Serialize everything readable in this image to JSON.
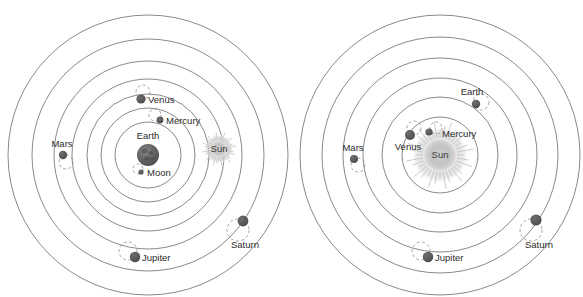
{
  "figure": {
    "title_visible": false,
    "background": "#ffffff",
    "orbit_stroke": "#6b6b6b",
    "epicycle_stroke": "#8d8d8d",
    "planet_fill": "#5a5a5a",
    "sun_fill": "#b9b9b9",
    "earth_fill": "#636363",
    "label_color": "#2b2b2b"
  },
  "diagrams": [
    {
      "id": "geocentric-model",
      "name": "ptolemaic-geocentric-diagram",
      "center": {
        "x": 148,
        "y": 155
      },
      "center_body": {
        "name": "Earth",
        "label": "Earth",
        "r": 11,
        "kind": "earth",
        "label_dx": 0,
        "label_dy": -16
      },
      "orbits": [
        140,
        116,
        94,
        76,
        61,
        47,
        33
      ],
      "bodies": [
        {
          "name": "Moon",
          "label": "Moon",
          "x": 141,
          "y": 172,
          "r": 2.6,
          "epicycle": {
            "cx": 138,
            "cy": 169,
            "r": 5
          },
          "label_dx": 6,
          "label_dy": 4,
          "anchor": "start"
        },
        {
          "name": "Sun",
          "label": "Sun",
          "x": 219,
          "y": 149,
          "r": 8.5,
          "kind": "sun",
          "label_dx": 0,
          "label_dy": 3,
          "anchor": "middle"
        },
        {
          "name": "Mercury",
          "label": "Mercury",
          "x": 160,
          "y": 120,
          "r": 3.4,
          "epicycle": {
            "cx": 155,
            "cy": 115,
            "r": 6
          },
          "label_dx": 6,
          "label_dy": 4,
          "anchor": "start"
        },
        {
          "name": "Venus",
          "label": "Venus",
          "x": 141,
          "y": 99,
          "r": 4.6,
          "epicycle": {
            "cx": 143,
            "cy": 92,
            "r": 7
          },
          "label_dx": 7,
          "label_dy": 4,
          "anchor": "start"
        },
        {
          "name": "Mars",
          "label": "Mars",
          "x": 63,
          "y": 155,
          "r": 4.2,
          "epicycle": {
            "cx": 66,
            "cy": 162,
            "r": 7
          },
          "label_dx": -1,
          "label_dy": -8,
          "anchor": "middle"
        },
        {
          "name": "Jupiter",
          "label": "Jupiter",
          "x": 135,
          "y": 257,
          "r": 5.2,
          "epicycle": {
            "cx": 128,
            "cy": 251,
            "r": 9
          },
          "label_dx": 7,
          "label_dy": 4,
          "anchor": "start"
        },
        {
          "name": "Saturn",
          "label": "Saturn",
          "x": 243,
          "y": 221,
          "r": 5.4,
          "epicycle": {
            "cx": 238,
            "cy": 230,
            "r": 11
          },
          "label_dx": 2,
          "label_dy": 27,
          "anchor": "middle"
        }
      ]
    },
    {
      "id": "heliocentric-model",
      "name": "copernican-heliocentric-diagram",
      "center": {
        "x": 440,
        "y": 155
      },
      "center_body": {
        "name": "Sun",
        "label": "Sun",
        "r": 17,
        "kind": "sun",
        "label_dx": 0,
        "label_dy": 3
      },
      "orbits": [
        140,
        118,
        97,
        77,
        58,
        38
      ],
      "bodies": [
        {
          "name": "Mercury",
          "label": "Mercury",
          "x": 429,
          "y": 132,
          "r": 3.6,
          "epicycle": {
            "cx": 436,
            "cy": 128,
            "r": 6
          },
          "label_dx": 13,
          "label_dy": 5,
          "anchor": "start"
        },
        {
          "name": "Venus",
          "label": "Venus",
          "x": 410,
          "y": 135,
          "r": 5.0,
          "epicycle": {
            "cx": 414,
            "cy": 128,
            "r": 7
          },
          "label_dx": -2,
          "label_dy": 15,
          "anchor": "middle"
        },
        {
          "name": "Earth",
          "label": "Earth",
          "x": 476,
          "y": 104,
          "r": 4.2,
          "epicycle": {
            "cx": 481,
            "cy": 102,
            "r": 8
          },
          "label_dx": -4,
          "label_dy": -9,
          "anchor": "middle"
        },
        {
          "name": "Mars",
          "label": "Mars",
          "x": 354,
          "y": 159,
          "r": 4.0,
          "epicycle": {
            "cx": 358,
            "cy": 165,
            "r": 7
          },
          "label_dx": -1,
          "label_dy": -8,
          "anchor": "middle"
        },
        {
          "name": "Jupiter",
          "label": "Jupiter",
          "x": 428,
          "y": 257,
          "r": 5.2,
          "epicycle": {
            "cx": 421,
            "cy": 251,
            "r": 9
          },
          "label_dx": 7,
          "label_dy": 4,
          "anchor": "start"
        },
        {
          "name": "Saturn",
          "label": "Saturn",
          "x": 536,
          "y": 220,
          "r": 5.6,
          "epicycle": {
            "cx": 531,
            "cy": 230,
            "r": 11
          },
          "label_dx": 3,
          "label_dy": 28,
          "anchor": "middle"
        }
      ]
    }
  ]
}
